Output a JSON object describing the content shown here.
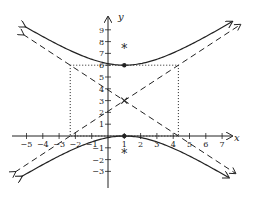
{
  "chart_data": {
    "type": "line",
    "title": "",
    "xlabel": "x",
    "ylabel": "y",
    "xlim": [
      -5.5,
      7.5
    ],
    "ylim": [
      -3.5,
      9.5
    ],
    "grid": false,
    "x_ticks": [
      -5,
      -4,
      -3,
      -2,
      -1,
      1,
      2,
      3,
      4,
      5,
      6,
      7
    ],
    "x_tick_labels": [
      "−5",
      "−4",
      "−3",
      "−2",
      "−1",
      "1",
      "2",
      "3",
      "4",
      "5",
      "6",
      "7"
    ],
    "y_ticks": [
      -3,
      -2,
      -1,
      1,
      2,
      3,
      4,
      5,
      6,
      7,
      8,
      9
    ],
    "y_tick_labels": [
      "−3",
      "−2",
      "−1",
      "1",
      "2",
      "3",
      "4",
      "5",
      "6",
      "7",
      "8",
      "9"
    ],
    "hyperbola": {
      "orientation": "vertical",
      "center": [
        1,
        3
      ],
      "a": 3,
      "b": 3.317,
      "equation": "(y-3)^2/9 - (x-1)^2/11 = 1",
      "vertices": [
        [
          1,
          6
        ],
        [
          1,
          0
        ]
      ],
      "foci": [
        [
          1,
          7.47
        ],
        [
          1,
          -1.47
        ]
      ]
    },
    "asymptotes": [
      {
        "name": "asymptote-positive",
        "slope": 0.904,
        "point": [
          1,
          3
        ],
        "style": "dashed"
      },
      {
        "name": "asymptote-negative",
        "slope": -0.904,
        "point": [
          1,
          3
        ],
        "style": "dashed"
      }
    ],
    "rectangle": {
      "x": [
        -2.317,
        4.317
      ],
      "y": [
        0,
        6
      ],
      "style": "dotted"
    },
    "markers": {
      "center": {
        "x": 1,
        "y": 3,
        "symbol": "×"
      },
      "vertices": [
        {
          "x": 1,
          "y": 6,
          "symbol": "●"
        },
        {
          "x": 1,
          "y": 0,
          "symbol": "●"
        }
      ],
      "foci": [
        {
          "x": 1,
          "y": 7.47,
          "symbol": "*"
        },
        {
          "x": 1,
          "y": -1.47,
          "symbol": "*"
        }
      ]
    }
  },
  "colors": {
    "ink": "#222222",
    "background": "#ffffff"
  }
}
